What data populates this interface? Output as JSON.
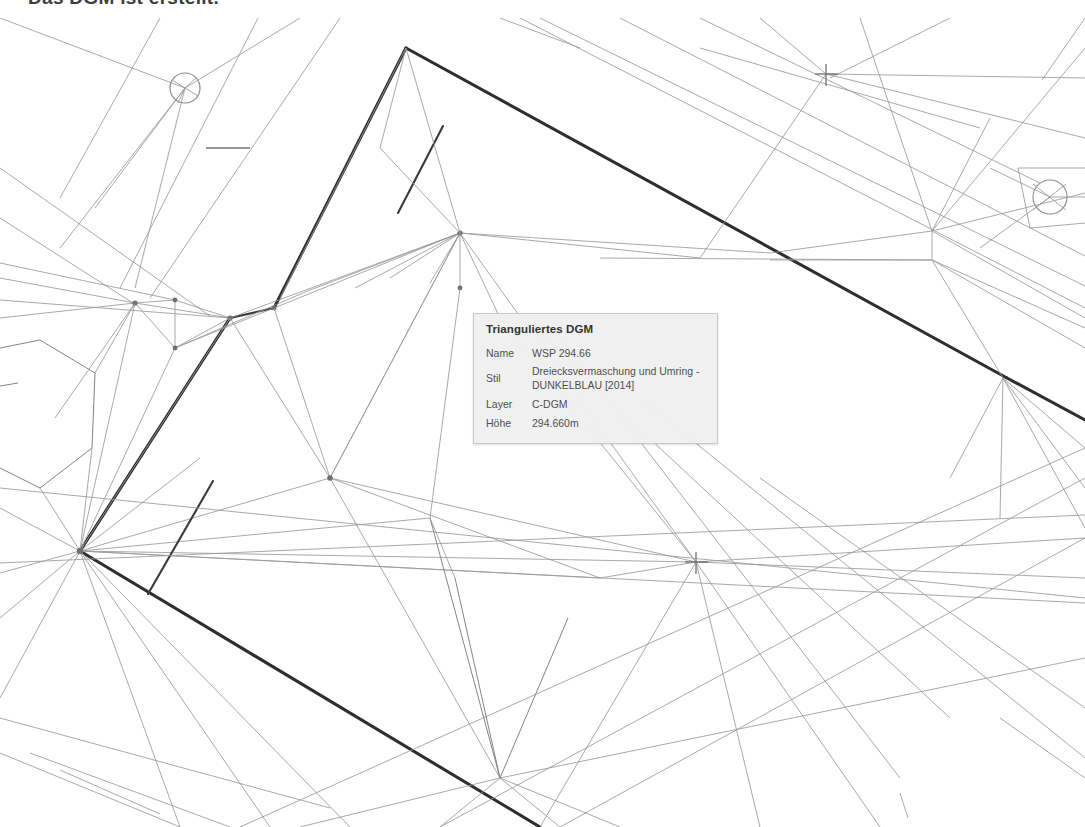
{
  "document": {
    "heading": "Das DGM ist erstellt."
  },
  "tooltip": {
    "title": "Trianguliertes DGM",
    "rows": [
      {
        "key": "Name",
        "value": "WSP 294.66"
      },
      {
        "key": "Stil",
        "value": "Dreiecksvermaschung und Umring - DUNKELBLAU [2014]"
      },
      {
        "key": "Layer",
        "value": "C-DGM"
      },
      {
        "key": "Höhe",
        "value": "294.660m"
      }
    ],
    "background_color": "#f0f0f0",
    "border_color": "#c8c8c8"
  },
  "canvas": {
    "name": "dgm-triangulation-view",
    "background_color": "#ffffff",
    "line_color_thin": "#8a8a8a",
    "line_color_bold": "#2b2b2b",
    "markers": [
      {
        "name": "circle-node-left",
        "x": 185,
        "y": 70,
        "r": 15
      },
      {
        "name": "circle-node-right",
        "x": 1050,
        "y": 179,
        "r": 17
      },
      {
        "name": "cross-marker-top",
        "x": 826,
        "y": 56
      },
      {
        "name": "cross-marker-mid",
        "x": 696,
        "y": 544
      }
    ]
  }
}
